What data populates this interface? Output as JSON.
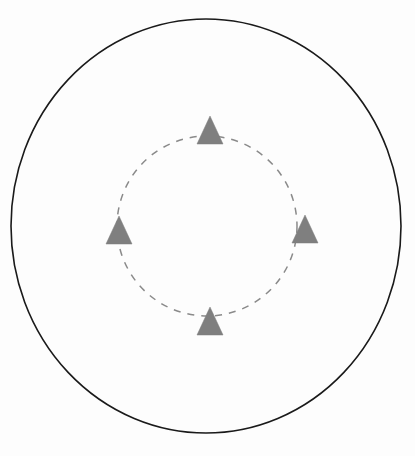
{
  "figure": {
    "background_color": "#fdfdfd",
    "width": 415,
    "height": 456
  },
  "canvas": {
    "center_x": 206,
    "center_y": 226
  },
  "outer_boundary": {
    "label": "outer-boundary-circle",
    "shape": "ellipse",
    "center_x": 206,
    "center_y": 226,
    "radius_x": 195,
    "radius_y": 207,
    "stroke_color": "#1a1a1a",
    "stroke_width": 1.6,
    "fill": "none",
    "style": "solid"
  },
  "inner_orbit": {
    "label": "inner-dashed-orbit-circle",
    "shape": "circle",
    "center_x": 207,
    "center_y": 226,
    "radius": 90,
    "stroke_color": "#8a8a8a",
    "stroke_width": 1.5,
    "fill": "none",
    "style": "dashed",
    "dash_pattern": "7 7"
  },
  "markers": {
    "label": "triangle-markers",
    "count": 4,
    "fill_color": "#7f7f7f",
    "stroke_color": "#7f7f7f",
    "base_width": 26,
    "height": 28,
    "items": [
      {
        "name": "triangle-marker-north",
        "position": "north",
        "angle_deg": 90,
        "center_x": 210,
        "center_y": 130,
        "rotation_deg": 0
      },
      {
        "name": "triangle-marker-east",
        "position": "east",
        "angle_deg": 0,
        "center_x": 305,
        "center_y": 229,
        "rotation_deg": 0
      },
      {
        "name": "triangle-marker-south",
        "position": "south",
        "angle_deg": 270,
        "center_x": 210,
        "center_y": 321,
        "rotation_deg": 0
      },
      {
        "name": "triangle-marker-west",
        "position": "west",
        "angle_deg": 180,
        "center_x": 119,
        "center_y": 230,
        "rotation_deg": 0
      }
    ]
  },
  "chart_data": {
    "type": "scatter",
    "xlabel": "",
    "ylabel": "",
    "grid": false,
    "legend": null,
    "xlim": [
      11,
      401
    ],
    "ylim": [
      19,
      434
    ],
    "series": [
      {
        "name": "triangle-markers",
        "marker": "triangle-up",
        "color": "#7f7f7f",
        "x": [
          210,
          305,
          210,
          119
        ],
        "y": [
          130,
          229,
          321,
          230
        ],
        "labels": [
          "north",
          "east",
          "south",
          "west"
        ]
      }
    ],
    "annotations": [
      {
        "name": "outer-boundary-circle",
        "type": "ellipse",
        "cx": 206,
        "cy": 226,
        "rx": 195,
        "ry": 207,
        "linestyle": "solid",
        "color": "#1a1a1a"
      },
      {
        "name": "inner-dashed-orbit-circle",
        "type": "circle",
        "cx": 207,
        "cy": 226,
        "r": 90,
        "linestyle": "dashed",
        "color": "#8a8a8a"
      }
    ]
  }
}
